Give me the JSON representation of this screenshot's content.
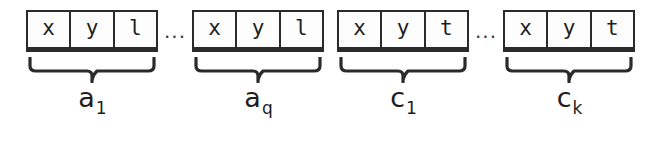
{
  "figure": {
    "type": "record-sequence-diagram",
    "background_color": "#ffffff",
    "line_color": "#2b2b2b",
    "text_color": "#1d1d1d",
    "ellipsis": "...",
    "groups": [
      {
        "id": "group-a1",
        "cells": [
          "x",
          "y",
          "l"
        ],
        "label_base": "a",
        "label_sub": "1",
        "label_full": "a1",
        "brace": "underbrace",
        "followed_by_ellipsis": true
      },
      {
        "id": "group-aq",
        "cells": [
          "x",
          "y",
          "l"
        ],
        "label_base": "a",
        "label_sub": "q",
        "label_full": "aq",
        "brace": "underbrace",
        "followed_by_ellipsis": false
      },
      {
        "id": "group-c1",
        "cells": [
          "x",
          "y",
          "t"
        ],
        "label_base": "c",
        "label_sub": "1",
        "label_full": "c1",
        "brace": "underbrace",
        "followed_by_ellipsis": true
      },
      {
        "id": "group-ck",
        "cells": [
          "x",
          "y",
          "t"
        ],
        "label_base": "c",
        "label_sub": "k",
        "label_full": "ck",
        "brace": "underbrace",
        "followed_by_ellipsis": false
      }
    ]
  }
}
